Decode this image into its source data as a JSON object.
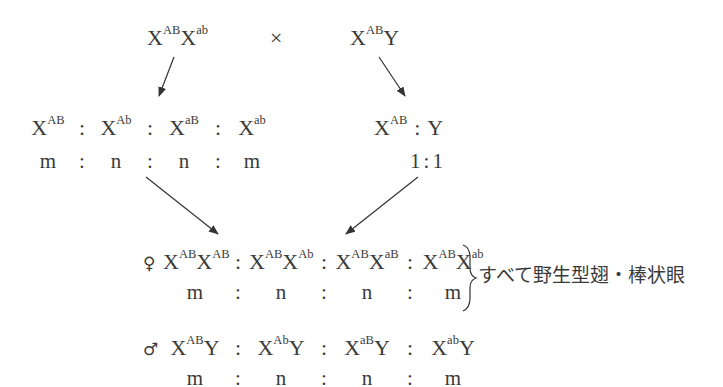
{
  "parents": {
    "female": {
      "base1": "X",
      "sup1": "AB",
      "base2": "X",
      "sup2": "ab"
    },
    "cross_symbol": "×",
    "male": {
      "base1": "X",
      "sup1": "AB",
      "base2": "Y"
    }
  },
  "female_gametes": {
    "items": [
      {
        "base": "X",
        "sup": "AB"
      },
      {
        "base": "X",
        "sup": "Ab"
      },
      {
        "base": "X",
        "sup": "aB"
      },
      {
        "base": "X",
        "sup": "ab"
      }
    ],
    "separator": ":",
    "ratio": [
      "m",
      "n",
      "n",
      "m"
    ]
  },
  "male_gametes": {
    "items": [
      {
        "base": "X",
        "sup": "AB"
      },
      {
        "base": "Y",
        "sup": ""
      }
    ],
    "separator": ":",
    "ratio": [
      "1",
      "1"
    ]
  },
  "offspring_female": {
    "symbol": "♀",
    "genotypes": [
      {
        "b1": "X",
        "s1": "AB",
        "b2": "X",
        "s2": "AB"
      },
      {
        "b1": "X",
        "s1": "AB",
        "b2": "X",
        "s2": "Ab"
      },
      {
        "b1": "X",
        "s1": "AB",
        "b2": "X",
        "s2": "aB"
      },
      {
        "b1": "X",
        "s1": "AB",
        "b2": "X",
        "s2": "ab"
      }
    ],
    "separator": ":",
    "ratio": [
      "m",
      "n",
      "n",
      "m"
    ],
    "phenotype_note": "すべて野生型翅・棒状眼"
  },
  "offspring_male": {
    "symbol": "♂",
    "genotypes": [
      {
        "b1": "X",
        "s1": "AB",
        "b2": "Y"
      },
      {
        "b1": "X",
        "s1": "Ab",
        "b2": "Y"
      },
      {
        "b1": "X",
        "s1": "aB",
        "b2": "Y"
      },
      {
        "b1": "X",
        "s1": "ab",
        "b2": "Y"
      }
    ],
    "separator": ":",
    "ratio": [
      "m",
      "n",
      "n",
      "m"
    ]
  },
  "colors": {
    "text": "#3a3a3a",
    "arrow": "#333333",
    "background": "#ffffff"
  }
}
